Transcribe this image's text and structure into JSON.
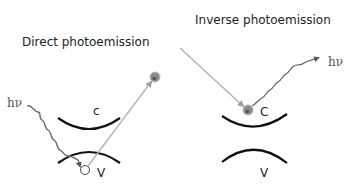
{
  "left_panel": {
    "title": "Direct photoemission",
    "photon_label": "hν",
    "conduction_label": "c",
    "valence_label": "V",
    "electron_label": "e"
  },
  "right_panel": {
    "title": "Inverse photoemission",
    "photon_label": "hν",
    "conduction_label": "C",
    "valence_label": "V",
    "electron_label": "e"
  },
  "colors": {
    "band_curve": "#111111",
    "photon_wave": "#666666",
    "electron_path": "#b0b0b0",
    "electron_fill": "#8a8a8a"
  }
}
